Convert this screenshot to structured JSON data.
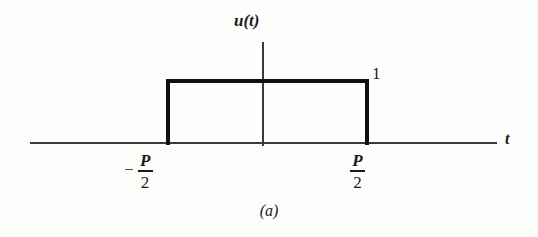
{
  "figure": {
    "caption": "(a)",
    "background_color": "#fdfdfc",
    "axis_color": "#3a3a3a",
    "curve_color": "#111111"
  },
  "axes": {
    "y_axis_label": "u(t)",
    "x_axis_label": "t"
  },
  "labels": {
    "amplitude": "1",
    "minus_sign": "−",
    "period_symbol": "P",
    "half_denominator": "2"
  },
  "chart_data": {
    "type": "line",
    "title": "",
    "subtitle": "",
    "xlabel": "t",
    "ylabel": "u(t)",
    "grid": false,
    "legend": null,
    "xlim": [
      -1.15,
      1.15
    ],
    "ylim": [
      -0.05,
      1.35
    ],
    "xticks": [
      -0.5,
      0.5
    ],
    "xticklabels": [
      "-P/2",
      "P/2"
    ],
    "yticks": [
      1
    ],
    "yticklabels": [
      "1"
    ],
    "annotations": [
      {
        "text": "1",
        "x": 0.52,
        "y": 1.06
      },
      {
        "text": "u(t)",
        "x": 0.0,
        "y": 1.32
      },
      {
        "text": "t",
        "x": 1.12,
        "y": 0.0
      },
      {
        "text": "(a)",
        "x": 0.0,
        "y": -0.55
      }
    ],
    "series": [
      {
        "name": "u(t)",
        "x": [
          -1.15,
          -0.5,
          -0.5,
          0.5,
          0.5,
          1.15
        ],
        "values": [
          0,
          0,
          1,
          1,
          0,
          0
        ]
      }
    ]
  }
}
